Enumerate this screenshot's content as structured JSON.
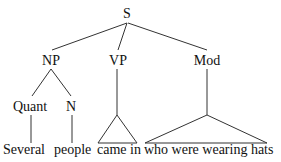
{
  "tree": {
    "root": "S",
    "level1": [
      "NP",
      "VP",
      "Mod"
    ],
    "np_children": [
      "Quant",
      "N"
    ],
    "words": {
      "quant": "Several",
      "n": "people",
      "vp": "came in",
      "mod": "who were wearing hats"
    }
  }
}
